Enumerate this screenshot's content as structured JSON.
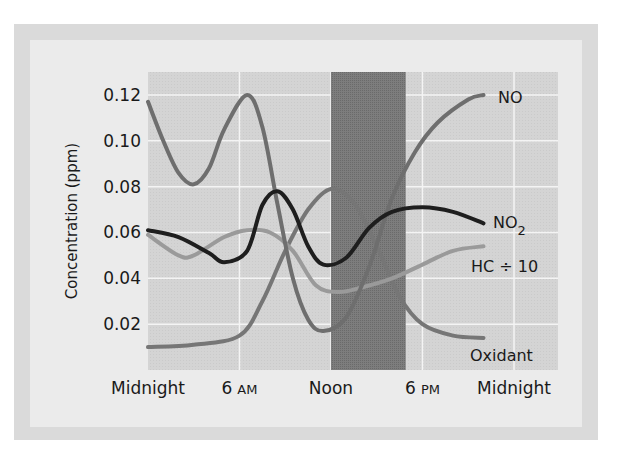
{
  "chart_data": {
    "type": "line",
    "title": "",
    "xlabel": "",
    "ylabel": "Concentration (ppm)",
    "x_unit": "hour of day",
    "xlim": [
      0,
      24
    ],
    "ylim": [
      0,
      0.13
    ],
    "grid": true,
    "x_ticks": [
      {
        "value": 0,
        "label": "Midnight"
      },
      {
        "value": 6,
        "label": "6",
        "suffix": "AM"
      },
      {
        "value": 12,
        "label": "Noon"
      },
      {
        "value": 18,
        "label": "6",
        "suffix": "PM"
      },
      {
        "value": 24,
        "label": "Midnight"
      }
    ],
    "y_ticks": [
      {
        "value": 0.02,
        "label": "0.02"
      },
      {
        "value": 0.04,
        "label": "0.04"
      },
      {
        "value": 0.06,
        "label": "0.06"
      },
      {
        "value": 0.08,
        "label": "0.08"
      },
      {
        "value": 0.1,
        "label": "0.10"
      },
      {
        "value": 0.12,
        "label": "0.12"
      }
    ],
    "shaded_region": {
      "x_start": 12.0,
      "x_end": 16.9,
      "color": "#7a7a7a"
    },
    "series": [
      {
        "name": "NO",
        "label": "NO",
        "color": "#6e6e6e",
        "points": [
          [
            0,
            0.117
          ],
          [
            1,
            0.1
          ],
          [
            2,
            0.086
          ],
          [
            3,
            0.081
          ],
          [
            4,
            0.088
          ],
          [
            5,
            0.105
          ],
          [
            6.5,
            0.12
          ],
          [
            7.5,
            0.106
          ],
          [
            8.5,
            0.072
          ],
          [
            9.5,
            0.04
          ],
          [
            10.5,
            0.022
          ],
          [
            11.5,
            0.017
          ],
          [
            13,
            0.023
          ],
          [
            14.5,
            0.045
          ],
          [
            16,
            0.075
          ],
          [
            17.5,
            0.095
          ],
          [
            19,
            0.108
          ],
          [
            21,
            0.118
          ],
          [
            22,
            0.12
          ]
        ]
      },
      {
        "name": "NO2",
        "label": "NO",
        "label_sub": "2",
        "color": "#1e1e1e",
        "points": [
          [
            0,
            0.061
          ],
          [
            2,
            0.058
          ],
          [
            4,
            0.051
          ],
          [
            5,
            0.047
          ],
          [
            6.5,
            0.052
          ],
          [
            7.5,
            0.072
          ],
          [
            8.5,
            0.078
          ],
          [
            9.5,
            0.07
          ],
          [
            10.5,
            0.054
          ],
          [
            11.5,
            0.046
          ],
          [
            13,
            0.049
          ],
          [
            14.5,
            0.062
          ],
          [
            16,
            0.069
          ],
          [
            18,
            0.071
          ],
          [
            20,
            0.069
          ],
          [
            22,
            0.064
          ]
        ]
      },
      {
        "name": "HC ÷ 10",
        "label": "HC ÷ 10",
        "color": "#9a9a9a",
        "points": [
          [
            0,
            0.059
          ],
          [
            2,
            0.05
          ],
          [
            3,
            0.05
          ],
          [
            5,
            0.058
          ],
          [
            6.5,
            0.061
          ],
          [
            8,
            0.06
          ],
          [
            9.5,
            0.052
          ],
          [
            11,
            0.037
          ],
          [
            12.5,
            0.034
          ],
          [
            14,
            0.036
          ],
          [
            16,
            0.04
          ],
          [
            18,
            0.046
          ],
          [
            20,
            0.052
          ],
          [
            22,
            0.054
          ]
        ]
      },
      {
        "name": "Oxidant",
        "label": "Oxidant",
        "color": "#767676",
        "points": [
          [
            0,
            0.01
          ],
          [
            3,
            0.011
          ],
          [
            6,
            0.015
          ],
          [
            7.5,
            0.03
          ],
          [
            9,
            0.052
          ],
          [
            10.5,
            0.07
          ],
          [
            12,
            0.079
          ],
          [
            13.5,
            0.073
          ],
          [
            15,
            0.054
          ],
          [
            16.5,
            0.032
          ],
          [
            18,
            0.02
          ],
          [
            20,
            0.015
          ],
          [
            22,
            0.014
          ]
        ]
      }
    ]
  },
  "layout": {
    "plot": {
      "left": 148,
      "top": 72,
      "right": 558,
      "bottom": 370
    },
    "x_px_per_hour": 15.25,
    "y_px_per_ppm": 2292
  }
}
